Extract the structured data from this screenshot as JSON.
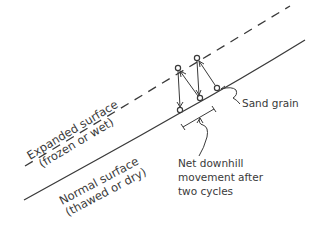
{
  "diagram": {
    "type": "soil-creep-frost-heave",
    "colors": {
      "ink": "#3a3a3a",
      "background": "#ffffff"
    },
    "surfaces": {
      "expanded": {
        "line1": "Expanded surface",
        "line2": "(frozen or wet)",
        "style": "dashed"
      },
      "normal": {
        "line1": "Normal surface",
        "line2": "(thawed or dry)",
        "style": "solid"
      }
    },
    "labels": {
      "sand_grain": "Sand grain",
      "net_movement_line1": "Net downhill",
      "net_movement_line2": "movement after",
      "net_movement_line3": "two cycles"
    },
    "grain_positions": {
      "normal": [
        [
          180,
          110
        ],
        [
          200,
          98
        ],
        [
          217,
          88
        ]
      ],
      "expanded": [
        [
          178,
          68
        ],
        [
          197,
          58
        ]
      ]
    }
  }
}
